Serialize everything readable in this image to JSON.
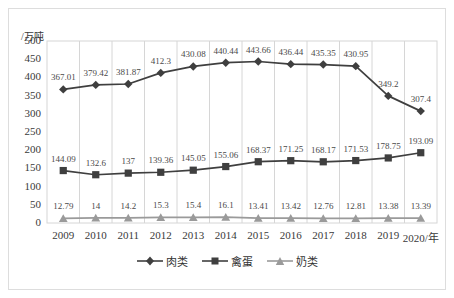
{
  "chart_data": {
    "type": "line",
    "title": "",
    "subtitle": "",
    "xlabel": "",
    "ylabel": "/万吨",
    "axis_unit_label": "/万吨",
    "categories": [
      "2009",
      "2010",
      "2011",
      "2012",
      "2013",
      "2014",
      "2015",
      "2016",
      "2017",
      "2018",
      "2019",
      "2020/年"
    ],
    "x": [
      2009,
      2010,
      2011,
      2012,
      2013,
      2014,
      2015,
      2016,
      2017,
      2018,
      2019,
      2020
    ],
    "ylim": [
      0,
      500
    ],
    "yticks": [
      "500",
      "450",
      "400",
      "350",
      "300",
      "250",
      "200",
      "150",
      "100",
      "50",
      "0"
    ],
    "ytick_values": [
      500,
      450,
      400,
      350,
      300,
      250,
      200,
      150,
      100,
      50,
      0
    ],
    "y_tick_step": 50,
    "grid": "vertical",
    "legend_position": "bottom",
    "series": [
      {
        "name": "肉类",
        "marker": "diamond",
        "color": "#3f3f3f",
        "values": [
          367.01,
          379.42,
          381.87,
          412.3,
          430.08,
          440.44,
          443.66,
          436.44,
          435.35,
          430.95,
          349.2,
          307.4
        ],
        "labels": [
          "367.01",
          "379.42",
          "381.87",
          "412.3",
          "430.08",
          "440.44",
          "443.66",
          "436.44",
          "435.35",
          "430.95",
          "349.2",
          "307.4"
        ]
      },
      {
        "name": "禽蛋",
        "marker": "square",
        "color": "#3f3f3f",
        "values": [
          144.09,
          132.6,
          137,
          139.36,
          145.05,
          155.06,
          168.37,
          171.25,
          168.17,
          171.53,
          178.75,
          193.09
        ],
        "labels": [
          "144.09",
          "132.6",
          "137",
          "139.36",
          "145.05",
          "155.06",
          "168.37",
          "171.25",
          "168.17",
          "171.53",
          "178.75",
          "193.09"
        ]
      },
      {
        "name": "奶类",
        "marker": "triangle",
        "color": "#9a9a9a",
        "values": [
          12.79,
          14,
          14.2,
          15.3,
          15.4,
          16.1,
          13.41,
          13.42,
          12.76,
          12.81,
          13.38,
          13.39
        ],
        "labels": [
          "12.79",
          "14",
          "14.2",
          "15.3",
          "15.4",
          "16.1",
          "13.41",
          "13.42",
          "12.76",
          "12.81",
          "13.38",
          "13.39"
        ]
      }
    ]
  },
  "legend": {
    "items": [
      {
        "label": "肉类"
      },
      {
        "label": "禽蛋"
      },
      {
        "label": "奶类"
      }
    ]
  },
  "colors": {
    "series_dark": "#3f3f3f",
    "series_gray": "#9a9a9a",
    "grid": "#d6d6d6",
    "frame": "#dddddd",
    "text": "#3a3a3a"
  }
}
